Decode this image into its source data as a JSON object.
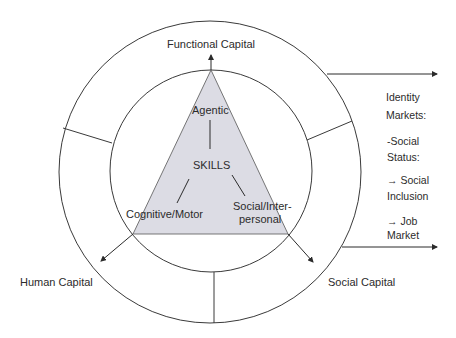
{
  "diagram": {
    "center": {
      "title": "SKILLS",
      "nodes": [
        {
          "id": "agentic",
          "label": "Agentic"
        },
        {
          "id": "cognitive",
          "label": "Cognitive/Motor"
        },
        {
          "id": "social",
          "label_line1": "Social/Inter-",
          "label_line2": "personal"
        }
      ]
    },
    "capitals": {
      "functional": "Functional Capital",
      "human": "Human Capital",
      "social": "Social Capital"
    },
    "identity_markets": {
      "heading_line1": "Identity",
      "heading_line2": "Markets:",
      "item1_line1": "-Social",
      "item1_line2": "Status:",
      "item2_line1": "→ Social",
      "item2_line2": "Inclusion",
      "item3_line1": "→ Job",
      "item3_line2": "Market"
    },
    "colors": {
      "triangle_fill": "#dcdce4",
      "line": "#3a3a3a"
    }
  }
}
